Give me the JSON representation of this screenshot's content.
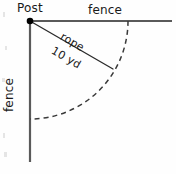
{
  "figure": {
    "background_color": "#fefefe",
    "line_color": "#5a5a5a",
    "rope_color": "#2b2b2b",
    "dash_color": "#3a3a3a",
    "post_color": "#000000",
    "labels": {
      "post": "Post",
      "fence_top": "fence",
      "fence_left": "fence",
      "rope": "rope",
      "rope_length": "10 yd"
    },
    "geometry": {
      "post_point": [
        30,
        21
      ],
      "post_radius": 3,
      "fence_top_line": [
        28,
        21,
        172,
        21
      ],
      "fence_left_line": [
        30,
        21,
        30,
        162
      ],
      "rope_line": [
        30,
        21,
        113,
        69
      ],
      "rope_angle_degrees": 30,
      "arc_radius": 98,
      "arc_start": [
        128,
        21
      ],
      "arc_end": [
        30,
        119
      ],
      "arc_sweep_degrees": 90,
      "dash_pattern": "5 4"
    }
  }
}
